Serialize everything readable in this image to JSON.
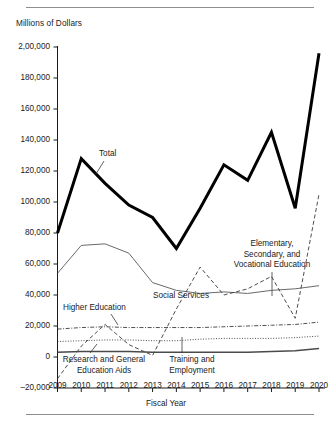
{
  "figure": {
    "y_axis_title": "Millions of Dollars",
    "x_axis_title": "Fiscal Year"
  },
  "chart_data": {
    "type": "line",
    "title": "",
    "xlabel": "Fiscal Year",
    "ylabel": "Millions of Dollars",
    "x": [
      2009,
      2010,
      2011,
      2012,
      2013,
      2014,
      2015,
      2016,
      2017,
      2018,
      2019,
      2020
    ],
    "xtick_labels": [
      "2009",
      "2010",
      "2011",
      "2012",
      "2013",
      "2014",
      "2015",
      "2016",
      "2017",
      "2018",
      "2019",
      "2020"
    ],
    "ytick_labels": [
      "2,00,000",
      "180,000",
      "160,000",
      "140,000",
      "120,000",
      "100,000",
      "80,000",
      "60,000",
      "40,000",
      "20,000",
      "0",
      "–20,000"
    ],
    "ytick_values": [
      200000,
      180000,
      160000,
      140000,
      120000,
      100000,
      80000,
      60000,
      40000,
      20000,
      0,
      -20000
    ],
    "ylim": [
      -20000,
      200000
    ],
    "xlim": [
      2009,
      2020
    ],
    "grid": false,
    "legend_position": "inline-annotations",
    "series": [
      {
        "name": "Total",
        "style": "solid-thick",
        "color": "#000000",
        "values": [
          80000,
          128000,
          112000,
          98000,
          90000,
          70000,
          96000,
          124000,
          114000,
          145000,
          96000,
          196000
        ]
      },
      {
        "name": "Social Services",
        "style": "solid-thin",
        "color": "#585858",
        "values": [
          54000,
          72000,
          73000,
          67000,
          48000,
          43000,
          41000,
          42000,
          41000,
          43000,
          44000,
          46000
        ]
      },
      {
        "name": "Elementary, Secondary, and Vocational Education",
        "style": "dashed",
        "color": "#3a3a3a",
        "values": [
          -14000,
          7000,
          21000,
          8000,
          1000,
          31000,
          58000,
          40000,
          44000,
          52000,
          25000,
          105000
        ]
      },
      {
        "name": "Higher Education",
        "style": "dash-dot",
        "color": "#3a3a3a",
        "values": [
          18000,
          19000,
          19500,
          19000,
          19000,
          19000,
          19000,
          19500,
          20000,
          20500,
          21000,
          22500
        ]
      },
      {
        "name": "Research and General Education Aids",
        "style": "dotted",
        "color": "#3a3a3a",
        "values": [
          10000,
          10500,
          11000,
          11000,
          10500,
          10500,
          11500,
          12000,
          12000,
          12000,
          12500,
          13500
        ]
      },
      {
        "name": "Training and Employment",
        "style": "solid-medium",
        "color": "#4a4a4a",
        "values": [
          3000,
          3500,
          3500,
          3500,
          3000,
          3000,
          3000,
          3000,
          3000,
          3500,
          4000,
          5500
        ]
      }
    ],
    "annotations": [
      {
        "id": "total",
        "text": "Total"
      },
      {
        "id": "social-services",
        "text": "Social Services"
      },
      {
        "id": "elementary",
        "line1": "Elementary,",
        "line2": "Secondary, and",
        "line3": "Vocational Education"
      },
      {
        "id": "higher-education",
        "text": "Higher Education"
      },
      {
        "id": "research",
        "line1": "Research and General",
        "line2": "Education Aids"
      },
      {
        "id": "training",
        "line1": "Training and",
        "line2": "Employment"
      }
    ]
  }
}
